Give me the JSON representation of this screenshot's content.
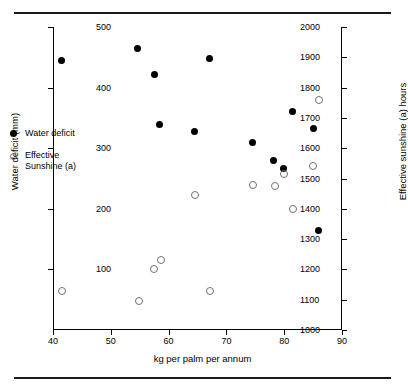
{
  "chart_data": {
    "type": "scatter",
    "title": "",
    "xlabel": "kg per palm per annum",
    "ylabel": "Water deficit (mm)",
    "y2label": "Effective sunshine (a) hours",
    "xlim": [
      40,
      90
    ],
    "ylim": [
      0,
      500
    ],
    "y2lim": [
      1000,
      2000
    ],
    "xticks": [
      40,
      50,
      60,
      70,
      80,
      90
    ],
    "yticks": [
      100,
      200,
      300,
      400,
      500
    ],
    "y2ticks": [
      1000,
      1100,
      1200,
      1300,
      1400,
      1500,
      1600,
      1700,
      1800,
      1900,
      2000
    ],
    "grid": false,
    "legend_position": "inside-left",
    "series": [
      {
        "name": "Water deficit",
        "marker": "filled-circle",
        "color": "#000000",
        "axis": "left",
        "points": [
          {
            "x": 41.5,
            "y": 444
          },
          {
            "x": 54.7,
            "y": 465
          },
          {
            "x": 57.5,
            "y": 422
          },
          {
            "x": 58.5,
            "y": 339
          },
          {
            "x": 64.5,
            "y": 328
          },
          {
            "x": 67.0,
            "y": 448
          },
          {
            "x": 74.5,
            "y": 310
          },
          {
            "x": 78.2,
            "y": 279
          },
          {
            "x": 79.9,
            "y": 266
          },
          {
            "x": 81.5,
            "y": 360
          },
          {
            "x": 85.0,
            "y": 333
          },
          {
            "x": 86.0,
            "y": 165
          }
        ]
      },
      {
        "name": "Effective Sunshine (a)",
        "marker": "open-circle",
        "color": "#6f6f6f",
        "axis": "right",
        "points": [
          {
            "x": 41.6,
            "y": 1130
          },
          {
            "x": 54.8,
            "y": 1095
          },
          {
            "x": 57.4,
            "y": 1200
          },
          {
            "x": 58.6,
            "y": 1230
          },
          {
            "x": 64.5,
            "y": 1445
          },
          {
            "x": 67.1,
            "y": 1130
          },
          {
            "x": 74.6,
            "y": 1480
          },
          {
            "x": 78.4,
            "y": 1475
          },
          {
            "x": 80.0,
            "y": 1515
          },
          {
            "x": 81.6,
            "y": 1400
          },
          {
            "x": 85.0,
            "y": 1540
          },
          {
            "x": 86.1,
            "y": 1760
          }
        ]
      }
    ]
  },
  "legend": {
    "items": [
      {
        "label": "Water deficit",
        "marker": "filled-circle"
      },
      {
        "label": "Effective\nSunshine (a)",
        "marker": "open-circle"
      }
    ],
    "item0_label": "Water deficit",
    "item1_label_line1": "Effective",
    "item1_label_line2": "Sunshine (a)"
  },
  "axes": {
    "x_title": "kg per palm per annum",
    "y_left_title": "Water deficit (mm)",
    "y_right_title": "Effective sunshine (a) hours"
  }
}
